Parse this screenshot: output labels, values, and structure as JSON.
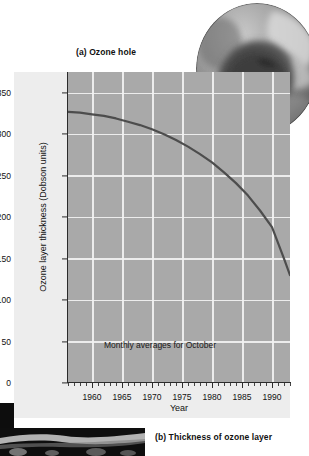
{
  "figure": {
    "caption_a": "(a) Ozone hole",
    "caption_b": "(b) Thickness of ozone layer",
    "globe_alt": "ozone-hole-satellite-image",
    "photo_alt": "antarctic-landscape-photo"
  },
  "colors": {
    "plot_background": "#a9a9a9",
    "panel_background": "#ededed",
    "gridline": "#f2f2f2",
    "curve": "#4d4d4d",
    "axis": "#2b2b2b",
    "text": "#111111"
  },
  "chart_data": {
    "type": "line",
    "title": "(a) Ozone hole",
    "annotation": "Monthly averages for October",
    "xlabel": "Year",
    "ylabel": "Ozone layer thickness (Dobson units)",
    "xlim": [
      1956,
      1993
    ],
    "ylim": [
      0,
      375
    ],
    "xticks": [
      1960,
      1965,
      1970,
      1975,
      1980,
      1985,
      1990
    ],
    "xticklabels": [
      "1960",
      "1965",
      "1970",
      "1975",
      "1980",
      "1985",
      "1990"
    ],
    "yticks": [
      0,
      50,
      100,
      150,
      200,
      250,
      300,
      350
    ],
    "yticklabels": [
      "0",
      "50",
      "100",
      "150",
      "200",
      "250",
      "300",
      "350"
    ],
    "minor_xtick_interval": 1,
    "grid": true,
    "legend": null,
    "series": [
      {
        "name": "Ozone layer thickness",
        "x": [
          1956,
          1958,
          1960,
          1962,
          1964,
          1966,
          1968,
          1970,
          1972,
          1974,
          1976,
          1978,
          1980,
          1982,
          1984,
          1986,
          1988,
          1990,
          1992,
          1993
        ],
        "values": [
          327,
          326,
          324,
          322,
          319,
          315,
          311,
          306,
          300,
          293,
          285,
          276,
          266,
          254,
          241,
          226,
          208,
          188,
          150,
          130
        ]
      }
    ]
  }
}
